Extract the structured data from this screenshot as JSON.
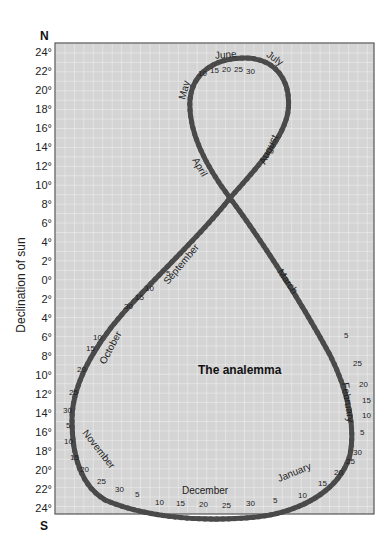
{
  "figure": {
    "title": "The analemma",
    "north_label": "N",
    "south_label": "S",
    "y_axis_label": "Declination of sun",
    "y_ticks_north": [
      "24°",
      "22°",
      "20°",
      "18°",
      "16°",
      "14°",
      "12°",
      "10°",
      "8°",
      "6°",
      "4°",
      "2°",
      "0°"
    ],
    "y_ticks_south": [
      "2°",
      "4°",
      "6°",
      "8°",
      "10°",
      "12°",
      "14°",
      "16°",
      "18°",
      "20°",
      "22°",
      "24°"
    ],
    "colors": {
      "background": "#d4d4d4",
      "grid": "#f2f2f2",
      "curve_dark": "#4a4a4a",
      "curve_light": "#ffffff",
      "frame": "#555555"
    }
  },
  "months": [
    {
      "name": "January",
      "label": "January"
    },
    {
      "name": "February",
      "label": "February"
    },
    {
      "name": "March",
      "label": "March"
    },
    {
      "name": "April",
      "label": "April"
    },
    {
      "name": "May",
      "label": "May"
    },
    {
      "name": "June",
      "label": "June"
    },
    {
      "name": "July",
      "label": "July"
    },
    {
      "name": "August",
      "label": "August"
    },
    {
      "name": "September",
      "label": "September"
    },
    {
      "name": "October",
      "label": "October"
    },
    {
      "name": "November",
      "label": "November"
    },
    {
      "name": "December",
      "label": "December"
    }
  ],
  "day_marks": [
    "5",
    "10",
    "15",
    "20",
    "25",
    "30"
  ]
}
